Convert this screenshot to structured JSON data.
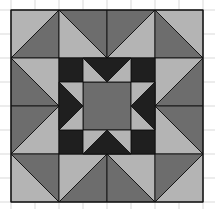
{
  "canvas": {
    "width": 215,
    "height": 209,
    "background": "#ffffff"
  },
  "colors": {
    "light": "#b4b4b4",
    "medium": "#6d6d6d",
    "dark": "#1f1f1f",
    "outline": "#111111",
    "grid": "#d9d9d9"
  },
  "grid": {
    "spacing": 24,
    "x_lines": [
      11,
      35,
      59,
      83,
      107,
      131,
      155,
      179,
      203
    ],
    "y_lines": [
      10,
      34,
      58,
      82,
      106,
      130,
      154,
      178,
      202
    ]
  },
  "quilt": {
    "origin": [
      11,
      10
    ],
    "size": 193,
    "unit": 48,
    "outer_ring": [
      {
        "name": "top-1",
        "x": 0,
        "y": 0,
        "diag": "/",
        "light": "tl",
        "medium": "br"
      },
      {
        "name": "top-2",
        "x": 1,
        "y": 0,
        "diag": "\\",
        "light": "bl",
        "medium": "tr"
      },
      {
        "name": "top-3",
        "x": 2,
        "y": 0,
        "diag": "/",
        "light": "br",
        "medium": "tl"
      },
      {
        "name": "top-4",
        "x": 3,
        "y": 0,
        "diag": "\\",
        "light": "tr",
        "medium": "bl"
      },
      {
        "name": "left-2",
        "x": 0,
        "y": 1,
        "diag": "\\",
        "light": "tr",
        "medium": "bl"
      },
      {
        "name": "left-3",
        "x": 0,
        "y": 2,
        "diag": "/",
        "light": "br",
        "medium": "tl"
      },
      {
        "name": "right-2",
        "x": 3,
        "y": 1,
        "diag": "/",
        "light": "tl",
        "medium": "br"
      },
      {
        "name": "right-3",
        "x": 3,
        "y": 2,
        "diag": "\\",
        "light": "bl",
        "medium": "tr"
      },
      {
        "name": "bottom-1",
        "x": 0,
        "y": 3,
        "diag": "\\",
        "light": "bl",
        "medium": "tr"
      },
      {
        "name": "bottom-2",
        "x": 1,
        "y": 3,
        "diag": "/",
        "light": "tl",
        "medium": "br"
      },
      {
        "name": "bottom-3",
        "x": 2,
        "y": 3,
        "diag": "\\",
        "light": "tr",
        "medium": "bl"
      },
      {
        "name": "bottom-4",
        "x": 3,
        "y": 3,
        "diag": "/",
        "light": "br",
        "medium": "tl"
      }
    ],
    "center_star": {
      "offset": 48,
      "size": 96,
      "corner_size": 24,
      "center_color": "medium",
      "corner_color": "dark",
      "point_color": "dark",
      "background_color": "light"
    }
  }
}
